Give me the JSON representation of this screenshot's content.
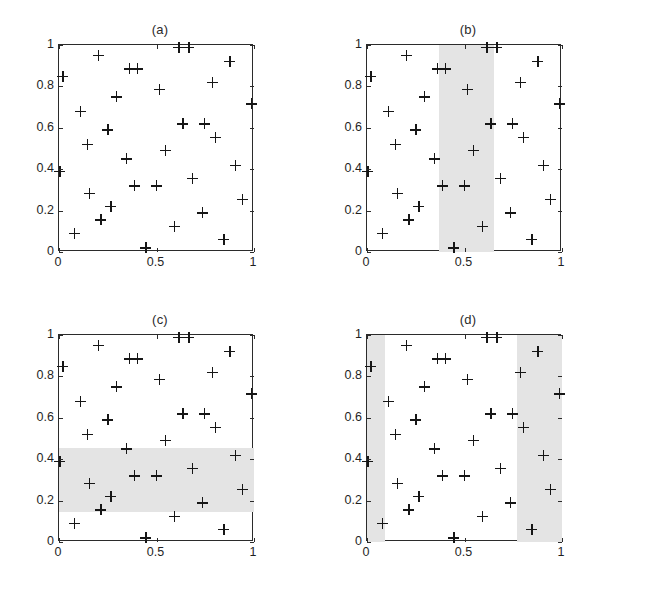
{
  "figure": {
    "kind": "four-panel-scatter",
    "background": "#ffffff",
    "marker": "plus",
    "marker_color": "#161616",
    "band_color": "#e4e4e4",
    "axis_color": "#2b2b2b"
  },
  "axes": {
    "xticks": [
      0,
      0.5,
      1
    ],
    "xtick_labels": [
      "0",
      "0.5",
      "1"
    ],
    "yticks": [
      0,
      0.2,
      0.4,
      0.6,
      0.8,
      1
    ],
    "ytick_labels": [
      "0",
      "0.2",
      "0.4",
      "0.6",
      "0.8",
      "1"
    ],
    "xlim": [
      0,
      1
    ],
    "ylim": [
      0,
      1
    ]
  },
  "chart_data": [
    {
      "type": "scatter",
      "title": "(a)",
      "panel": "a",
      "xlabel": "",
      "ylabel": "",
      "xlim": [
        0,
        1
      ],
      "ylim": [
        0,
        1
      ],
      "grid": false,
      "legend": false,
      "marker": "+",
      "shaded_regions": [],
      "x": [
        0.005,
        0.02,
        0.08,
        0.11,
        0.145,
        0.155,
        0.2,
        0.215,
        0.25,
        0.265,
        0.295,
        0.345,
        0.36,
        0.385,
        0.4,
        0.445,
        0.5,
        0.515,
        0.545,
        0.59,
        0.615,
        0.635,
        0.665,
        0.685,
        0.735,
        0.745,
        0.785,
        0.8,
        0.845,
        0.875,
        0.905,
        0.94,
        0.985
      ],
      "y": [
        0.39,
        0.85,
        0.09,
        0.68,
        0.52,
        0.285,
        0.95,
        0.155,
        0.59,
        0.22,
        0.75,
        0.45,
        0.885,
        0.32,
        0.885,
        0.02,
        0.32,
        0.785,
        0.49,
        0.125,
        0.99,
        0.62,
        0.99,
        0.355,
        0.19,
        0.62,
        0.82,
        0.555,
        0.06,
        0.92,
        0.42,
        0.255,
        0.715
      ]
    },
    {
      "type": "scatter",
      "title": "(b)",
      "panel": "b",
      "xlabel": "",
      "ylabel": "",
      "xlim": [
        0,
        1
      ],
      "ylim": [
        0,
        1
      ],
      "grid": false,
      "legend": false,
      "marker": "+",
      "shaded_regions": [
        {
          "orientation": "vertical",
          "x0": 0.37,
          "x1": 0.65,
          "y0": 0,
          "y1": 1
        }
      ],
      "x": [
        0.005,
        0.02,
        0.08,
        0.11,
        0.145,
        0.155,
        0.2,
        0.215,
        0.25,
        0.265,
        0.295,
        0.345,
        0.36,
        0.385,
        0.4,
        0.445,
        0.5,
        0.515,
        0.545,
        0.59,
        0.615,
        0.635,
        0.665,
        0.685,
        0.735,
        0.745,
        0.785,
        0.8,
        0.845,
        0.875,
        0.905,
        0.94,
        0.985
      ],
      "y": [
        0.39,
        0.85,
        0.09,
        0.68,
        0.52,
        0.285,
        0.95,
        0.155,
        0.59,
        0.22,
        0.75,
        0.45,
        0.885,
        0.32,
        0.885,
        0.02,
        0.32,
        0.785,
        0.49,
        0.125,
        0.99,
        0.62,
        0.99,
        0.355,
        0.19,
        0.62,
        0.82,
        0.555,
        0.06,
        0.92,
        0.42,
        0.255,
        0.715
      ]
    },
    {
      "type": "scatter",
      "title": "(c)",
      "panel": "c",
      "xlabel": "",
      "ylabel": "",
      "xlim": [
        0,
        1
      ],
      "ylim": [
        0,
        1
      ],
      "grid": false,
      "legend": false,
      "marker": "+",
      "shaded_regions": [
        {
          "orientation": "horizontal",
          "x0": 0,
          "x1": 1,
          "y0": 0.145,
          "y1": 0.455
        }
      ],
      "x": [
        0.005,
        0.02,
        0.08,
        0.11,
        0.145,
        0.155,
        0.2,
        0.215,
        0.25,
        0.265,
        0.295,
        0.345,
        0.36,
        0.385,
        0.4,
        0.445,
        0.5,
        0.515,
        0.545,
        0.59,
        0.615,
        0.635,
        0.665,
        0.685,
        0.735,
        0.745,
        0.785,
        0.8,
        0.845,
        0.875,
        0.905,
        0.94,
        0.985
      ],
      "y": [
        0.39,
        0.85,
        0.09,
        0.68,
        0.52,
        0.285,
        0.95,
        0.155,
        0.59,
        0.22,
        0.75,
        0.45,
        0.885,
        0.32,
        0.885,
        0.02,
        0.32,
        0.785,
        0.49,
        0.125,
        0.99,
        0.62,
        0.99,
        0.355,
        0.19,
        0.62,
        0.82,
        0.555,
        0.06,
        0.92,
        0.42,
        0.255,
        0.715
      ]
    },
    {
      "type": "scatter",
      "title": "(d)",
      "panel": "d",
      "xlabel": "",
      "ylabel": "",
      "xlim": [
        0,
        1
      ],
      "ylim": [
        0,
        1
      ],
      "grid": false,
      "legend": false,
      "marker": "+",
      "shaded_regions": [
        {
          "orientation": "vertical",
          "x0": 0,
          "x1": 0.09,
          "y0": 0,
          "y1": 1
        },
        {
          "orientation": "vertical",
          "x0": 0.77,
          "x1": 1,
          "y0": 0,
          "y1": 1
        }
      ],
      "x": [
        0.005,
        0.02,
        0.08,
        0.11,
        0.145,
        0.155,
        0.2,
        0.215,
        0.25,
        0.265,
        0.295,
        0.345,
        0.36,
        0.385,
        0.4,
        0.445,
        0.5,
        0.515,
        0.545,
        0.59,
        0.615,
        0.635,
        0.665,
        0.685,
        0.735,
        0.745,
        0.785,
        0.8,
        0.845,
        0.875,
        0.905,
        0.94,
        0.985
      ],
      "y": [
        0.39,
        0.85,
        0.09,
        0.68,
        0.52,
        0.285,
        0.95,
        0.155,
        0.59,
        0.22,
        0.75,
        0.45,
        0.885,
        0.32,
        0.885,
        0.02,
        0.32,
        0.785,
        0.49,
        0.125,
        0.99,
        0.62,
        0.99,
        0.355,
        0.19,
        0.62,
        0.82,
        0.555,
        0.06,
        0.92,
        0.42,
        0.255,
        0.715
      ]
    }
  ]
}
